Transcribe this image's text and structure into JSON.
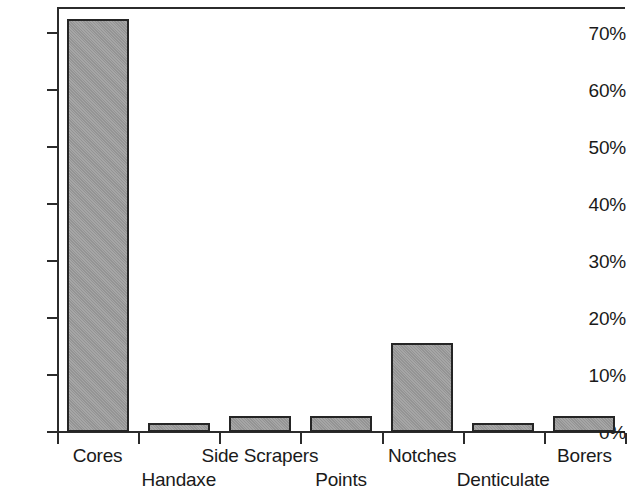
{
  "chart_data": {
    "type": "bar",
    "title": "",
    "subtitle": "",
    "xlabel": "",
    "ylabel": "",
    "categories": [
      "Cores",
      "Handaxe",
      "Side Scrapers",
      "Points",
      "Notches",
      "Denticulate",
      "Borers"
    ],
    "values": [
      72.5,
      1.5,
      2.8,
      2.8,
      15.7,
      1.5,
      2.8
    ],
    "value_unit": "%",
    "ylim": [
      0,
      75
    ],
    "ytick_values": [
      0,
      10,
      20,
      30,
      40,
      50,
      60,
      70
    ],
    "ytick_labels": [
      "0%",
      "10%",
      "20%",
      "30%",
      "40%",
      "50%",
      "60%",
      "70%"
    ],
    "grid": false,
    "legend": null,
    "legend_position": "none",
    "series": [
      {
        "name": "",
        "values": [
          72.5,
          1.5,
          2.8,
          2.8,
          15.7,
          1.5,
          2.8
        ]
      }
    ],
    "label_rows": [
      "top",
      "bottom",
      "top",
      "bottom",
      "top",
      "bottom",
      "top"
    ],
    "bar_color": "#9c9c9c",
    "bar_border_color": "#252525",
    "axis_color": "#2b2b2b",
    "background_color": "#ffffff"
  }
}
